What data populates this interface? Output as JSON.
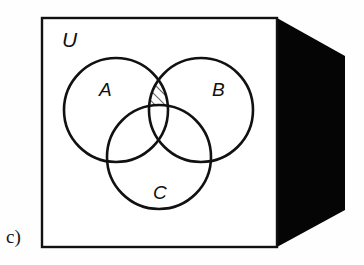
{
  "figure": {
    "part_label": "c)",
    "type": "venn-diagram",
    "background_color": "#fefefe",
    "ink_color": "#111111",
    "shadow_color": "#050505"
  },
  "universe": {
    "label": "U",
    "label_x": 62,
    "label_y": 47,
    "box": {
      "x": 42,
      "y": 18,
      "width": 235,
      "height": 229,
      "stroke_width": 2.4,
      "fill": "#ffffff"
    },
    "depth_face": {
      "points": "277,18 345,56 345,210 277,247",
      "fill": "#050505"
    }
  },
  "sets": [
    {
      "name": "A",
      "label": "A",
      "cx": 116,
      "cy": 110,
      "r": 52,
      "label_x": 99,
      "label_y": 96
    },
    {
      "name": "B",
      "label": "B",
      "cx": 201,
      "cy": 110,
      "r": 52,
      "label_x": 212,
      "label_y": 96
    },
    {
      "name": "C",
      "label": "C",
      "cx": 159,
      "cy": 157,
      "r": 52,
      "label_x": 153,
      "label_y": 199
    }
  ],
  "shaded_region": {
    "expression": "(A ∩ B) \\ C",
    "description": "The lens where circles A and B overlap, excluding the part inside circle C, filled with diagonal hatching",
    "hatch": {
      "pattern": "diagonal",
      "direction": "lower-left to upper-right",
      "spacing": 7,
      "stroke_width": 1.3,
      "color": "#111111"
    }
  },
  "chart_data": {
    "type": "diagram",
    "title": "",
    "sets": [
      "A",
      "B",
      "C"
    ],
    "universe": "U",
    "shaded": "(A ∩ B) \\ C",
    "regions": [
      {
        "id": "A-only",
        "shaded": false
      },
      {
        "id": "B-only",
        "shaded": false
      },
      {
        "id": "C-only",
        "shaded": false
      },
      {
        "id": "A∩B only",
        "shaded": true
      },
      {
        "id": "A∩C only",
        "shaded": false
      },
      {
        "id": "B∩C only",
        "shaded": false
      },
      {
        "id": "A∩B∩C",
        "shaded": false
      },
      {
        "id": "outside all (U only)",
        "shaded": false
      }
    ]
  }
}
